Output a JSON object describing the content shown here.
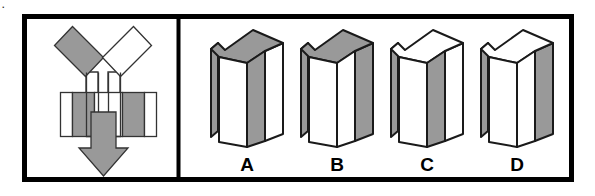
{
  "item": {
    "type": "spatial-visualization-multiple-choice",
    "corner_mark": ".",
    "prompt_panel_label": "unfolded-net",
    "options_panel_label": "folded-figure-choices"
  },
  "colors": {
    "ink": "#000000",
    "paper": "#ffffff",
    "shade_gray": "#999999",
    "outline": "#1a1a1a",
    "border": "#000000"
  },
  "frame": {
    "x": 22,
    "y": 14,
    "width": 552,
    "height": 168,
    "stroke_width": 5,
    "divider_x": 178
  },
  "net": {
    "label": "folding-net",
    "parts": [
      {
        "name": "diamond-left",
        "fill": "#999999",
        "description": "gray square rotated 45 degrees, upper left flap"
      },
      {
        "name": "diamond-right",
        "fill": "#ffffff",
        "description": "white square rotated 45 degrees, upper right flap"
      },
      {
        "name": "band-left-end",
        "fill": "#999999",
        "description": "gray rectangle at left end of horizontal band"
      },
      {
        "name": "band-left-inner",
        "fill": "#ffffff",
        "description": "white rectangle"
      },
      {
        "name": "band-center",
        "fill": "#ffffff",
        "description": "white center rectangle of band"
      },
      {
        "name": "band-right-inner",
        "fill": "#ffffff",
        "description": "white rectangle"
      },
      {
        "name": "band-right-end",
        "fill": "#999999",
        "description": "gray rectangle at right end of horizontal band"
      },
      {
        "name": "fold-arrow",
        "fill": "#999999",
        "description": "large gray downward arrow indicating fold direction"
      },
      {
        "name": "tab-left",
        "fill": "#ffffff",
        "description": "small white connector tab under left diamond"
      },
      {
        "name": "tab-right",
        "fill": "#ffffff",
        "description": "small white connector tab under right diamond"
      }
    ]
  },
  "options": [
    {
      "id": "A",
      "label": "A",
      "cx": 247,
      "faces": {
        "top": "#999999",
        "front": "#ffffff",
        "right": "#999999",
        "left_flap": "#999999",
        "right_flap": "#ffffff"
      }
    },
    {
      "id": "B",
      "label": "B",
      "cx": 337,
      "faces": {
        "top": "#999999",
        "front": "#ffffff",
        "right": "#ffffff",
        "left_flap": "#999999",
        "right_flap": "#999999"
      }
    },
    {
      "id": "C",
      "label": "C",
      "cx": 427,
      "faces": {
        "top": "#ffffff",
        "front": "#ffffff",
        "right": "#999999",
        "left_flap": "#999999",
        "right_flap": "#ffffff"
      }
    },
    {
      "id": "D",
      "label": "D",
      "cx": 517,
      "faces": {
        "top": "#ffffff",
        "front": "#ffffff",
        "right": "#ffffff",
        "left_flap": "#999999",
        "right_flap": "#999999"
      }
    }
  ]
}
